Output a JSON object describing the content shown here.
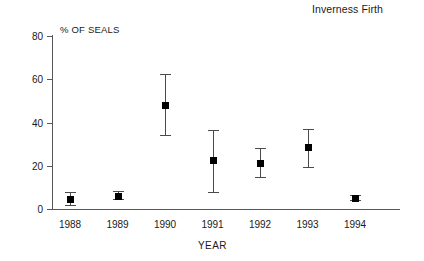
{
  "chart_data": {
    "type": "scatter",
    "title": "Inverness Firth",
    "xlabel": "YEAR",
    "ylabel": "% OF SEALS",
    "categories": [
      "1988",
      "1989",
      "1990",
      "1991",
      "1992",
      "1993",
      "1994"
    ],
    "values": [
      4.5,
      6,
      48,
      22.5,
      21,
      28.5,
      5
    ],
    "error_low": [
      2,
      4.5,
      34,
      8,
      15,
      19.5,
      4
    ],
    "error_high": [
      8,
      8.5,
      62.5,
      36.5,
      28,
      37,
      6.5
    ],
    "ylim": [
      0,
      80
    ],
    "yticks": [
      0,
      20,
      40,
      60,
      80
    ],
    "ytick_labels": [
      "0",
      "20",
      "40",
      "60",
      "80"
    ],
    "grid": false,
    "legend": false,
    "marker_style": "filled-square",
    "error_bar_style": "capped-vertical",
    "colors": {
      "marker": "#000000",
      "error_bar": "#4a4a4c",
      "axis": "#58585a",
      "text": "#1a1a1a",
      "background": "#ffffff"
    }
  }
}
